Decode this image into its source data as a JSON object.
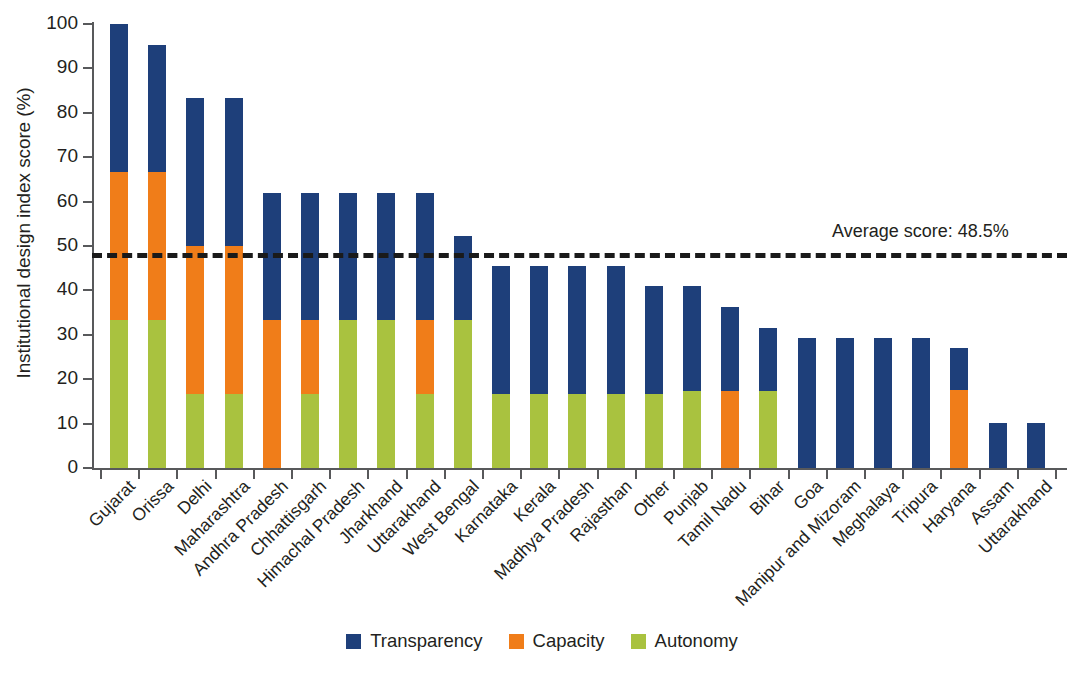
{
  "chart_data": {
    "type": "bar",
    "stacked": true,
    "title": "",
    "subtitle": "",
    "xlabel": "",
    "ylabel": "Institutional design index score (%)",
    "ylim": [
      0,
      100
    ],
    "yticks": [
      0,
      10,
      20,
      30,
      40,
      50,
      60,
      70,
      80,
      90,
      100
    ],
    "grid": false,
    "legend_position": "bottom",
    "categories": [
      "Gujarat",
      "Orissa",
      "Delhi",
      "Maharashtra",
      "Andhra Pradesh",
      "Chhattisgarh",
      "Himachal Pradesh",
      "Jharkhand",
      "Uttarakhand",
      "West Bengal",
      "Karnataka",
      "Kerala",
      "Madhya Pradesh",
      "Rajasthan",
      "Other",
      "Punjab",
      "Tamil Nadu",
      "Bihar",
      "Goa",
      "Manipur and Mizoram",
      "Meghalaya",
      "Tripura",
      "Haryana",
      "Assam",
      "Uttarakhand"
    ],
    "series": [
      {
        "name": "Autonomy",
        "color": "#a9c23f",
        "values": [
          33.3,
          33.3,
          16.7,
          16.7,
          0,
          16.7,
          33.3,
          33.3,
          16.7,
          33.3,
          16.7,
          16.7,
          16.7,
          16.7,
          16.7,
          17.3,
          0,
          17.3,
          0,
          0,
          0,
          0,
          0,
          0,
          0
        ]
      },
      {
        "name": "Capacity",
        "color": "#f07d19",
        "values": [
          33.4,
          33.4,
          33.3,
          33.3,
          33.3,
          16.6,
          0,
          0,
          16.6,
          0,
          0,
          0,
          0,
          0,
          0,
          0,
          17.3,
          0,
          0,
          0,
          0,
          0,
          17.5,
          0,
          0
        ]
      },
      {
        "name": "Transparency",
        "color": "#1e3f7a",
        "values": [
          33.3,
          28.5,
          33.3,
          33.3,
          28.7,
          28.7,
          28.7,
          28.7,
          28.7,
          19.0,
          28.8,
          28.8,
          28.8,
          28.8,
          24.2,
          23.7,
          19.0,
          14.2,
          29.2,
          29.2,
          29.2,
          29.2,
          9.5,
          10.2,
          10.2
        ]
      }
    ],
    "totals": [
      100.0,
      95.2,
      83.3,
      83.3,
      62.0,
      62.0,
      62.0,
      62.0,
      62.0,
      52.3,
      45.5,
      45.5,
      45.5,
      45.5,
      40.9,
      41.0,
      36.3,
      31.5,
      29.2,
      29.2,
      29.2,
      29.2,
      27.0,
      10.2,
      10.2
    ],
    "annotations": [
      {
        "name": "average-line",
        "label": "Average score: 48.5%",
        "value": 48.5,
        "style": "dashed",
        "color": "#1a1a1a"
      }
    ],
    "legend": [
      {
        "label": "Transparency",
        "color": "#1e3f7a",
        "key": "transparency"
      },
      {
        "label": "Capacity",
        "color": "#f07d19",
        "key": "capacity"
      },
      {
        "label": "Autonomy",
        "color": "#a9c23f",
        "key": "autonomy"
      }
    ]
  }
}
